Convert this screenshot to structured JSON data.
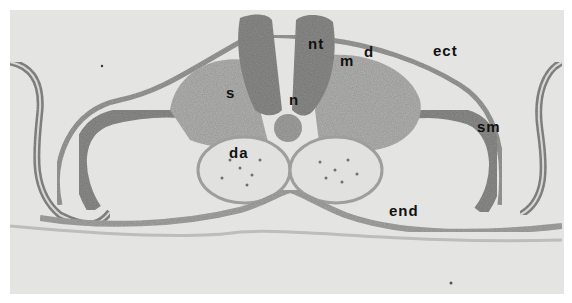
{
  "figure": {
    "type": "histological cross-section micrograph (grayscale)",
    "labels": [
      {
        "id": "nt",
        "text": "nt",
        "x": 308,
        "y": 36
      },
      {
        "id": "m",
        "text": "m",
        "x": 340,
        "y": 53
      },
      {
        "id": "d",
        "text": "d",
        "x": 364,
        "y": 44
      },
      {
        "id": "ect",
        "text": "ect",
        "x": 433,
        "y": 43
      },
      {
        "id": "s",
        "text": "s",
        "x": 226,
        "y": 85
      },
      {
        "id": "n",
        "text": "n",
        "x": 289,
        "y": 92
      },
      {
        "id": "sm",
        "text": "sm",
        "x": 477,
        "y": 119
      },
      {
        "id": "da",
        "text": "da",
        "x": 229,
        "y": 145
      },
      {
        "id": "end",
        "text": "end",
        "x": 389,
        "y": 203
      }
    ]
  }
}
